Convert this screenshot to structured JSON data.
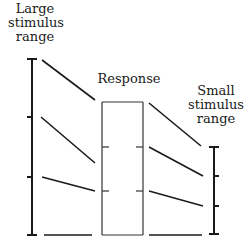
{
  "labels": {
    "large_range": [
      "Large",
      "stimulus",
      "range"
    ],
    "response": "Response",
    "small_range": [
      "Small",
      "stimulus",
      "range"
    ]
  },
  "colors": {
    "ink": "#1a1a1a",
    "box": "#333333",
    "background": "#ffffff"
  },
  "geometry": {
    "large_axis": {
      "x": 32,
      "y_top": 59,
      "y_bottom": 235,
      "ticks": [
        59,
        117,
        177,
        235
      ]
    },
    "response_box": {
      "x1": 102,
      "x2": 143,
      "y_top": 102,
      "y_bottom": 235,
      "inner_ticks": [
        147,
        191
      ]
    },
    "small_axis": {
      "x": 214,
      "y_top": 147,
      "y_bottom": 234,
      "ticks": [
        147,
        176,
        206,
        234
      ]
    },
    "left_mapping_lines": [
      [
        42,
        60,
        95,
        100
      ],
      [
        41,
        117,
        95,
        163
      ],
      [
        42,
        177,
        95,
        191
      ],
      [
        44,
        235,
        92,
        235
      ]
    ],
    "right_mapping_lines": [
      [
        149,
        103,
        201,
        146
      ],
      [
        149,
        147,
        203,
        176
      ],
      [
        149,
        191,
        203,
        206
      ],
      [
        149,
        235,
        202,
        235
      ]
    ]
  }
}
